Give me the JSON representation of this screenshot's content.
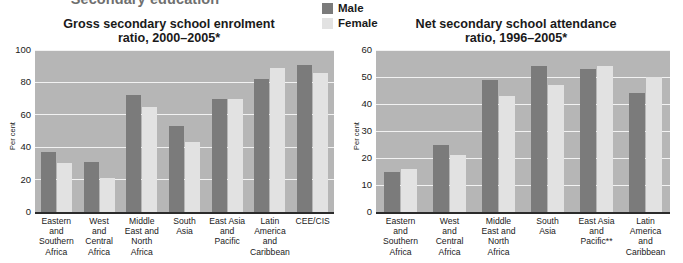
{
  "section_heading": "Secondary education",
  "legend": {
    "position": "top-center",
    "items": [
      {
        "label": "Male",
        "color": "#7b7b7b",
        "swatch_name": "legend-swatch-male"
      },
      {
        "label": "Female",
        "color": "#e2e2e2",
        "swatch_name": "legend-swatch-female"
      }
    ]
  },
  "colors": {
    "male": "#7b7b7b",
    "female": "#e2e2e2",
    "plot_background": "#b6b6b6",
    "gridline": "#f2f2f2",
    "axis": "#2b2b2b",
    "text": "#1a1a1a",
    "section_heading": "#6f6f6f"
  },
  "chart_data": [
    {
      "id": "gross-secondary-enrolment",
      "type": "bar",
      "title": "Gross secondary school enrolment\nratio, 2000–2005*",
      "xlabel": "",
      "ylabel": "Per cent",
      "ylim": [
        0,
        100
      ],
      "yticks": [
        0,
        20,
        40,
        60,
        80,
        100
      ],
      "grid": true,
      "categories": [
        "Eastern\nand\nSouthern\nAfrica",
        "West\nand\nCentral\nAfrica",
        "Middle\nEast and\nNorth\nAfrica",
        "South\nAsia",
        "East Asia\nand\nPacific",
        "Latin\nAmerica\nand\nCaribbean",
        "CEE/CIS"
      ],
      "series": [
        {
          "name": "Male",
          "values": [
            37,
            31,
            72,
            53,
            70,
            82,
            91
          ]
        },
        {
          "name": "Female",
          "values": [
            30,
            21,
            65,
            43,
            70,
            89,
            86
          ]
        }
      ]
    },
    {
      "id": "net-secondary-attendance",
      "type": "bar",
      "title": "Net secondary school attendance\nratio, 1996–2005*",
      "xlabel": "",
      "ylabel": "Per cent",
      "ylim": [
        0,
        60
      ],
      "yticks": [
        0,
        10,
        20,
        30,
        40,
        50,
        60
      ],
      "grid": true,
      "categories": [
        "Eastern\nand\nSouthern\nAfrica",
        "West\nand\nCentral\nAfrica",
        "Middle\nEast and\nNorth\nAfrica",
        "South\nAsia",
        "East Asia\nand\nPacific**",
        "Latin\nAmerica\nand\nCaribbean"
      ],
      "series": [
        {
          "name": "Male",
          "values": [
            15,
            25,
            49,
            54,
            53,
            44
          ]
        },
        {
          "name": "Female",
          "values": [
            16,
            21,
            43,
            47,
            54,
            50
          ]
        }
      ]
    }
  ]
}
